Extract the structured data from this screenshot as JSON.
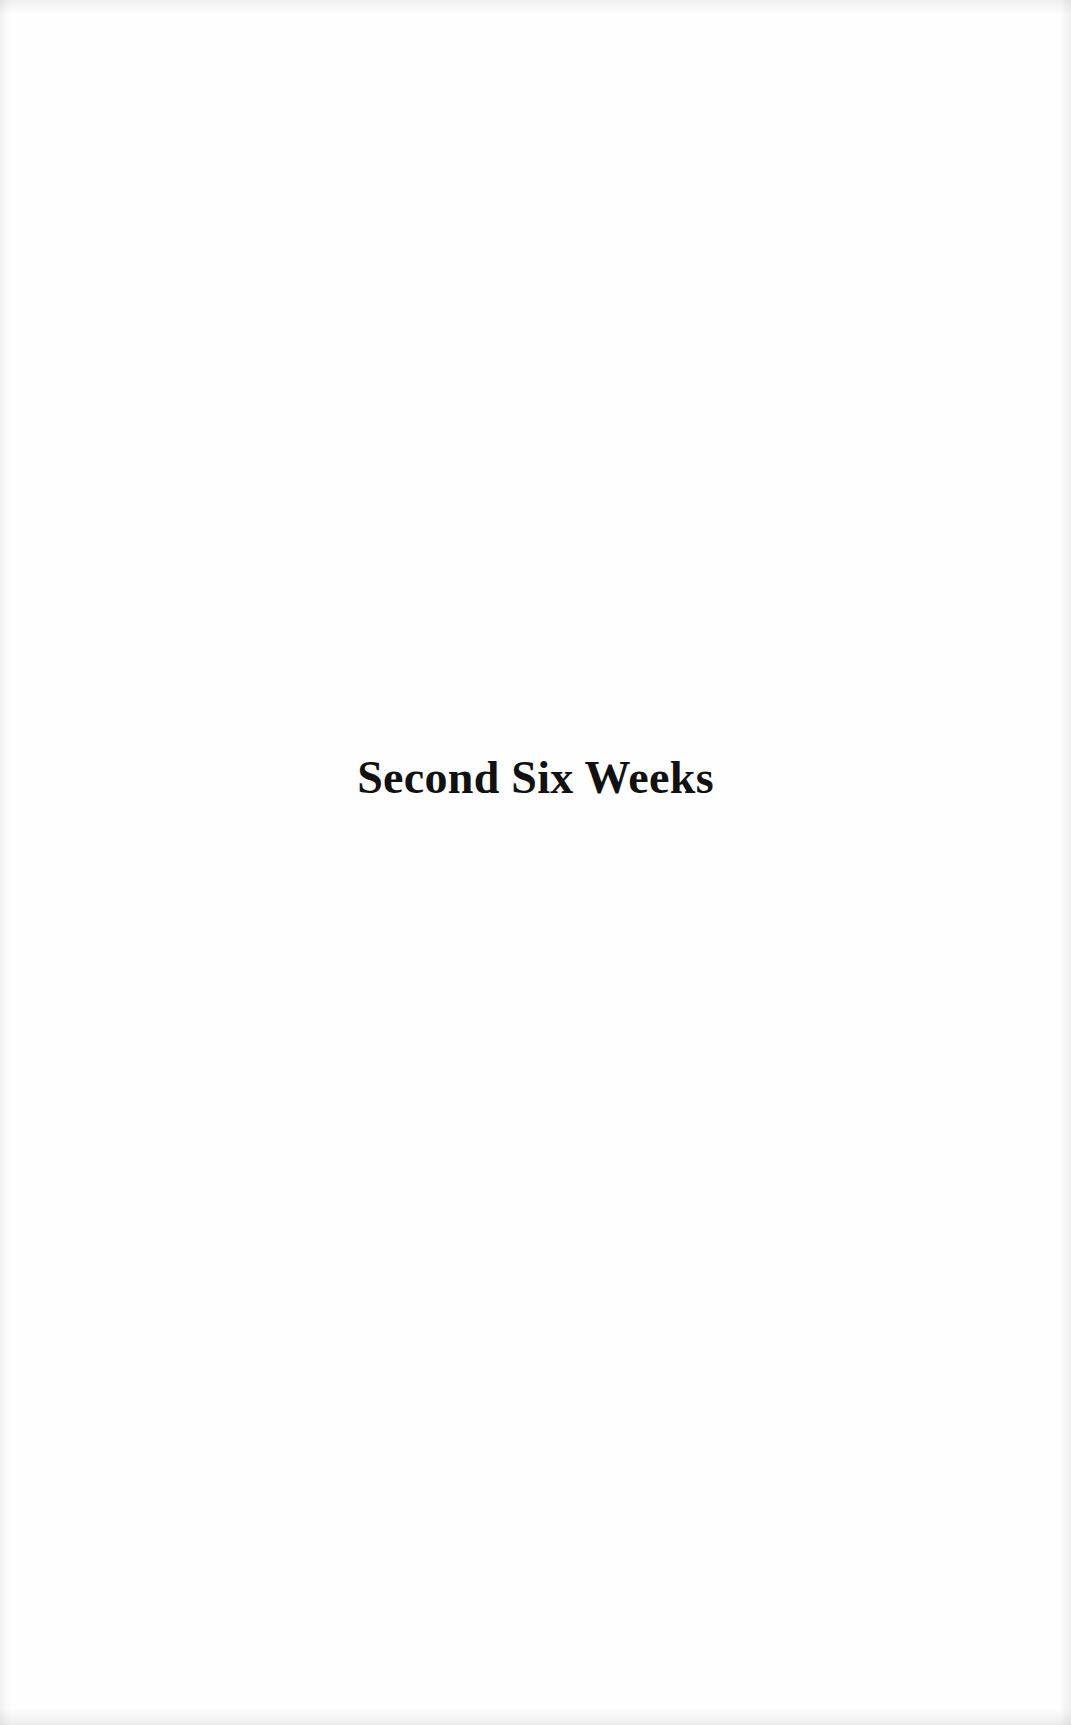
{
  "page": {
    "heading": "Second Six Weeks"
  }
}
